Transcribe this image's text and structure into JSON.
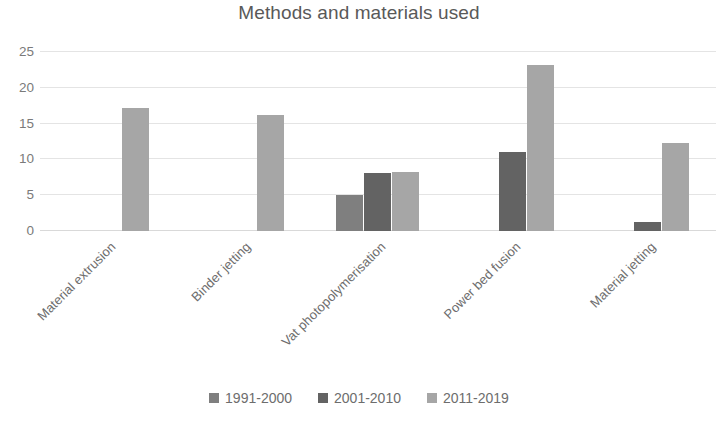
{
  "chart_data": {
    "type": "bar",
    "title": "Methods and materials used",
    "xlabel": "",
    "ylabel": "",
    "ylim": [
      0,
      25
    ],
    "yticks": [
      0,
      5,
      10,
      15,
      20,
      25
    ],
    "grid": true,
    "legend_position": "bottom",
    "categories": [
      "Material extrusion",
      "Binder jetting",
      "Vat photopolymerisation",
      "Power bed fusion",
      "Material jetting"
    ],
    "series": [
      {
        "name": "1991-2000",
        "color": "#7f7f7f",
        "values": [
          0,
          0,
          5,
          0,
          0
        ]
      },
      {
        "name": "2001-2010",
        "color": "#636363",
        "values": [
          0,
          0,
          8.1,
          11.1,
          1.2
        ]
      },
      {
        "name": "2011-2019",
        "color": "#a6a6a6",
        "values": [
          17.2,
          16.2,
          8.2,
          23.2,
          12.3
        ]
      }
    ]
  },
  "colors": {
    "text": "#595959",
    "tick_text": "#7a7a7a",
    "gridline": "#e4e4e4",
    "axis": "#d9d9d9",
    "background": "#ffffff"
  }
}
